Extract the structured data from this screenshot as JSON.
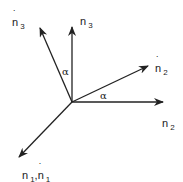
{
  "diagram": {
    "type": "vector-rotation",
    "origin": [
      72,
      102
    ],
    "vectors": [
      {
        "id": "n3_hat",
        "label": "n",
        "subscript": "3",
        "hat": true,
        "end": [
          40,
          28
        ]
      },
      {
        "id": "n3",
        "label": "n",
        "subscript": "3",
        "hat": false,
        "end": [
          72,
          28
        ]
      },
      {
        "id": "n2_hat",
        "label": "n",
        "subscript": "2",
        "hat": true,
        "end": [
          148,
          66
        ]
      },
      {
        "id": "n2",
        "label": "n",
        "subscript": "2",
        "hat": false,
        "end": [
          162,
          102
        ]
      },
      {
        "id": "n1",
        "label": "n",
        "subscript": "1",
        "hat": false,
        "end": [
          20,
          156
        ]
      }
    ],
    "labels": {
      "n3_hat": {
        "base": "n",
        "sub": "3"
      },
      "n3": {
        "base": "n",
        "sub": "3"
      },
      "n2_hat": {
        "base": "n",
        "sub": "2"
      },
      "n2": {
        "base": "n",
        "sub": "2"
      },
      "n1_base": "n",
      "n1_sub": "1",
      "n1_sep": ",",
      "n1_hat_base": "n",
      "n1_hat_sub": "1"
    },
    "angles": [
      {
        "symbol": "α",
        "between": [
          "n3",
          "n3_hat"
        ]
      },
      {
        "symbol": "α",
        "between": [
          "n2",
          "n2_hat"
        ]
      }
    ],
    "color": "#222222"
  }
}
